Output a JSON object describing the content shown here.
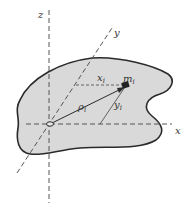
{
  "figure": {
    "labels": {
      "z_axis": "z",
      "y_axis": "y",
      "x_axis": "x",
      "mass": "m",
      "mass_sub": "i",
      "x_coord": "x",
      "x_coord_sub": "i",
      "y_coord": "y",
      "y_coord_sub": "i",
      "rho": "ρ",
      "rho_sub": "i"
    },
    "colors": {
      "fill": "#d9d9d9",
      "outline": "#2a2a2a",
      "axis": "#555555",
      "text": "#333333"
    }
  }
}
